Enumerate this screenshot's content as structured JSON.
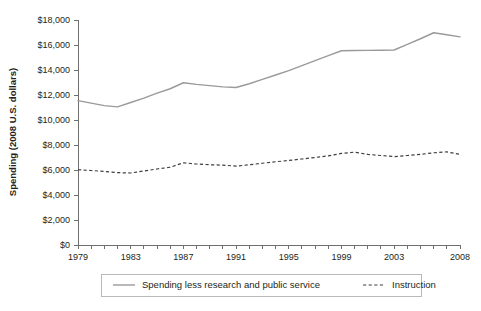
{
  "chart_data": {
    "type": "line",
    "title": "",
    "xlabel": "",
    "ylabel": "Spending (2008 U.S. dollars)",
    "xlim": [
      1979,
      2008
    ],
    "ylim": [
      0,
      18000
    ],
    "grid": false,
    "legend_position": "bottom",
    "x": [
      1979,
      1980,
      1981,
      1982,
      1983,
      1984,
      1985,
      1986,
      1987,
      1988,
      1989,
      1990,
      1991,
      1992,
      1993,
      1994,
      1995,
      1996,
      1997,
      1998,
      1999,
      2000,
      2001,
      2002,
      2003,
      2004,
      2005,
      2006,
      2007,
      2008
    ],
    "x_tick_labels": [
      "1979",
      "1983",
      "1987",
      "1991",
      "1995",
      "1999",
      "2003",
      "2008"
    ],
    "x_tick_values": [
      1979,
      1983,
      1987,
      1991,
      1995,
      1999,
      2003,
      2008
    ],
    "y_tick_labels": [
      "$0",
      "$2,000",
      "$4,000",
      "$6,000",
      "$8,000",
      "$10,000",
      "$12,000",
      "$14,000",
      "$16,000",
      "$18,000"
    ],
    "y_tick_values": [
      0,
      2000,
      4000,
      6000,
      8000,
      10000,
      12000,
      14000,
      16000,
      18000
    ],
    "series": [
      {
        "name": "Spending less research and public service",
        "style": "solid",
        "color": "#9a9a9a",
        "values": [
          11550,
          11350,
          11150,
          11050,
          11400,
          11750,
          12150,
          12500,
          12980,
          12850,
          12750,
          12650,
          12600,
          12900,
          13250,
          13600,
          13950,
          14350,
          14750,
          15150,
          15540,
          15560,
          15570,
          15580,
          15600,
          16050,
          16500,
          16980,
          16820,
          16650
        ]
      },
      {
        "name": "Instruction",
        "style": "dashed",
        "color": "#3f3f3f",
        "values": [
          6020,
          5960,
          5880,
          5790,
          5760,
          5920,
          6080,
          6220,
          6580,
          6480,
          6420,
          6390,
          6310,
          6420,
          6540,
          6660,
          6760,
          6880,
          7000,
          7130,
          7330,
          7430,
          7250,
          7160,
          7070,
          7160,
          7250,
          7380,
          7450,
          7250
        ]
      }
    ]
  },
  "legend": {
    "items": [
      {
        "label": "Spending less research and public service",
        "style": "solid"
      },
      {
        "label": "Instruction",
        "style": "dashed"
      }
    ]
  }
}
